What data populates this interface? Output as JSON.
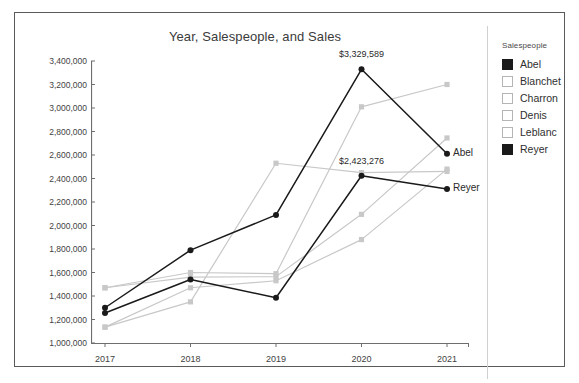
{
  "chart_data": {
    "type": "line",
    "title": "Year, Salespeople, and Sales",
    "xlabel": "",
    "ylabel": "",
    "categories": [
      "2017",
      "2018",
      "2019",
      "2020",
      "2021"
    ],
    "x": [
      2017,
      2018,
      2019,
      2020,
      2021
    ],
    "ylim": [
      1000000,
      3400000
    ],
    "ytick_step": 200000,
    "ytick_labels": [
      "3,400,000",
      "3,200,000",
      "3,000,000",
      "2,800,000",
      "2,600,000",
      "2,400,000",
      "2,200,000",
      "2,000,000",
      "1,800,000",
      "1,600,000",
      "1,400,000",
      "1,200,000",
      "1,000,000"
    ],
    "ytick_values": [
      3400000,
      3200000,
      3000000,
      2800000,
      2600000,
      2400000,
      2200000,
      2000000,
      1800000,
      1600000,
      1400000,
      1200000,
      1000000
    ],
    "grid": false,
    "legend_position": "right",
    "legend_title": "Salespeople",
    "series": [
      {
        "name": "Abel",
        "color": "#1a1a1a",
        "emphasis": true,
        "values": [
          1300000,
          1790000,
          2090000,
          3329589,
          2610000
        ]
      },
      {
        "name": "Blanchet",
        "color": "#c8c8c8",
        "emphasis": false,
        "values": [
          1470000,
          1600000,
          1590000,
          3010000,
          3200000
        ]
      },
      {
        "name": "Charron",
        "color": "#c8c8c8",
        "emphasis": false,
        "values": [
          1135000,
          1350000,
          2530000,
          2450000,
          2460000
        ]
      },
      {
        "name": "Denis",
        "color": "#c8c8c8",
        "emphasis": false,
        "values": [
          1470000,
          1560000,
          1565000,
          2095000,
          2745000
        ]
      },
      {
        "name": "Leblanc",
        "color": "#c8c8c8",
        "emphasis": false,
        "values": [
          1135000,
          1470000,
          1530000,
          1880000,
          2480000
        ]
      },
      {
        "name": "Reyer",
        "color": "#1a1a1a",
        "emphasis": true,
        "values": [
          1255000,
          1540000,
          1385000,
          2423276,
          2310000
        ]
      }
    ],
    "annotations": [
      {
        "text": "$3,329,589",
        "series": "Abel",
        "x": "2020",
        "value": 3329589
      },
      {
        "text": "$2,423,276",
        "series": "Reyer",
        "x": "2020",
        "value": 2423276
      }
    ],
    "end_labels": [
      {
        "text": "Abel",
        "series": "Abel",
        "x": "2021",
        "value": 2610000
      },
      {
        "text": "Reyer",
        "series": "Reyer",
        "x": "2021",
        "value": 2310000
      }
    ]
  },
  "legend": {
    "title": "Salespeople",
    "items": [
      {
        "label": "Abel",
        "swatch": "#1a1a1a",
        "filled": true
      },
      {
        "label": "Blanchet",
        "swatch": "#ffffff",
        "filled": false
      },
      {
        "label": "Charron",
        "swatch": "#ffffff",
        "filled": false
      },
      {
        "label": "Denis",
        "swatch": "#ffffff",
        "filled": false
      },
      {
        "label": "Leblanc",
        "swatch": "#ffffff",
        "filled": false
      },
      {
        "label": "Reyer",
        "swatch": "#1a1a1a",
        "filled": true
      }
    ]
  }
}
